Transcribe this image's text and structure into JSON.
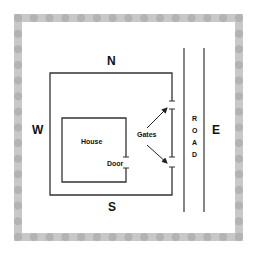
{
  "diagram": {
    "directions": {
      "north": "N",
      "south": "S",
      "west": "W",
      "east": "E"
    },
    "labels": {
      "house": "House",
      "door": "Door",
      "gates": "Gates"
    },
    "road": {
      "letters": [
        "R",
        "O",
        "A",
        "D"
      ]
    },
    "colors": {
      "line": "#333333",
      "border": "#c8c8c8",
      "background": "#ffffff"
    }
  }
}
